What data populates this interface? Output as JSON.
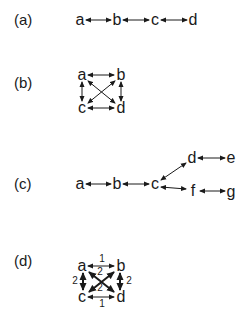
{
  "colors": {
    "ink": "#1a1a1a",
    "background": "#ffffff"
  },
  "panels": [
    {
      "label": "(a)",
      "nodes": [
        {
          "id": "a",
          "label": "a",
          "x": 80,
          "y": 20
        },
        {
          "id": "b",
          "label": "b",
          "x": 117,
          "y": 20
        },
        {
          "id": "c",
          "label": "c",
          "x": 155,
          "y": 20
        },
        {
          "id": "d",
          "label": "d",
          "x": 193,
          "y": 20
        }
      ],
      "edges": [
        {
          "from": "a",
          "to": "b",
          "type": "bidirectional"
        },
        {
          "from": "b",
          "to": "c",
          "type": "bidirectional"
        },
        {
          "from": "c",
          "to": "d",
          "type": "bidirectional"
        }
      ]
    },
    {
      "label": "(b)",
      "nodes": [
        {
          "id": "a",
          "label": "a",
          "x": 82,
          "y": 76
        },
        {
          "id": "b",
          "label": "b",
          "x": 120,
          "y": 76
        },
        {
          "id": "c",
          "label": "c",
          "x": 82,
          "y": 108
        },
        {
          "id": "d",
          "label": "d",
          "x": 120,
          "y": 108
        }
      ],
      "edges": [
        {
          "from": "a",
          "to": "b",
          "type": "bidirectional"
        },
        {
          "from": "a",
          "to": "c",
          "type": "bidirectional"
        },
        {
          "from": "b",
          "to": "d",
          "type": "bidirectional"
        },
        {
          "from": "c",
          "to": "d",
          "type": "bidirectional"
        },
        {
          "from": "a",
          "to": "d",
          "type": "bidirectional"
        },
        {
          "from": "b",
          "to": "c",
          "type": "bidirectional"
        }
      ]
    },
    {
      "label": "(c)",
      "nodes": [
        {
          "id": "a",
          "label": "a",
          "x": 80,
          "y": 184
        },
        {
          "id": "b",
          "label": "b",
          "x": 117,
          "y": 184
        },
        {
          "id": "c",
          "label": "c",
          "x": 155,
          "y": 184
        },
        {
          "id": "d",
          "label": "d",
          "x": 192,
          "y": 158
        },
        {
          "id": "e",
          "label": "e",
          "x": 231,
          "y": 158
        },
        {
          "id": "f",
          "label": "f",
          "x": 192,
          "y": 191
        },
        {
          "id": "g",
          "label": "g",
          "x": 231,
          "y": 191
        }
      ],
      "edges": [
        {
          "from": "a",
          "to": "b",
          "type": "bidirectional"
        },
        {
          "from": "b",
          "to": "c",
          "type": "bidirectional"
        },
        {
          "from": "c",
          "to": "d",
          "type": "bidirectional"
        },
        {
          "from": "c",
          "to": "f",
          "type": "bidirectional"
        },
        {
          "from": "d",
          "to": "e",
          "type": "bidirectional"
        },
        {
          "from": "f",
          "to": "g",
          "type": "bidirectional"
        }
      ]
    },
    {
      "label": "(d)",
      "nodes": [
        {
          "id": "a",
          "label": "a",
          "x": 82,
          "y": 266
        },
        {
          "id": "b",
          "label": "b",
          "x": 120,
          "y": 266
        },
        {
          "id": "c",
          "label": "c",
          "x": 82,
          "y": 297
        },
        {
          "id": "d",
          "label": "d",
          "x": 120,
          "y": 297
        }
      ],
      "edges": [
        {
          "from": "a",
          "to": "b",
          "type": "bidirectional",
          "weight": "1"
        },
        {
          "from": "c",
          "to": "d",
          "type": "bidirectional",
          "weight": "1"
        },
        {
          "from": "a",
          "to": "c",
          "type": "bidirectional",
          "weight": "2"
        },
        {
          "from": "b",
          "to": "d",
          "type": "bidirectional",
          "weight": "2"
        },
        {
          "from": "a",
          "to": "d",
          "type": "bidirectional",
          "weight": "2"
        },
        {
          "from": "b",
          "to": "c",
          "type": "bidirectional",
          "weight": "2"
        }
      ],
      "weight_labels": {
        "top": "1",
        "bottom": "1",
        "left": "2",
        "right": "2",
        "diag_upper": "2",
        "diag_lower": "2"
      }
    }
  ]
}
